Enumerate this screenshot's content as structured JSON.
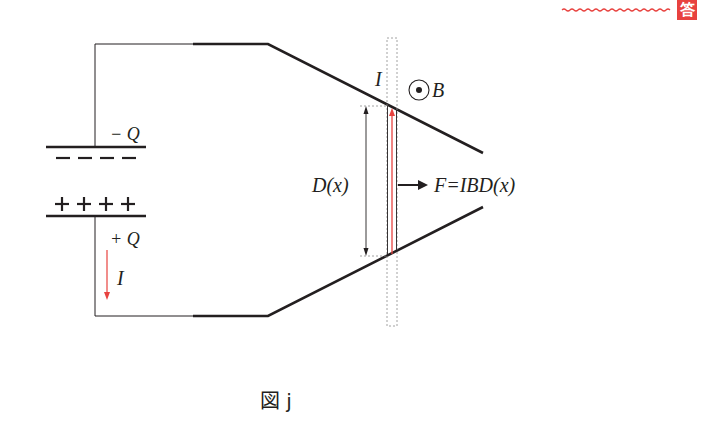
{
  "figure": {
    "caption": "図 j",
    "answer_badge": {
      "label": "答",
      "color": "#e8423f"
    },
    "colors": {
      "line": "#231f20",
      "current": "#e8423f",
      "guide": "#8a8a8a"
    }
  },
  "capacitor": {
    "top_charge_label": "− Q",
    "bottom_charge_label": "+ Q",
    "top_plate_signs": "− − − −",
    "bottom_plate_signs": "+ + + +",
    "current_label": "I"
  },
  "rails": {
    "description": "Two converging conducting rails connected to capacitor"
  },
  "rod": {
    "current_label": "I",
    "field_label": "B",
    "field_symbol": "out-of-page (⊙)",
    "length_label": "D(x)",
    "force_label": "F=IBD(x)"
  }
}
